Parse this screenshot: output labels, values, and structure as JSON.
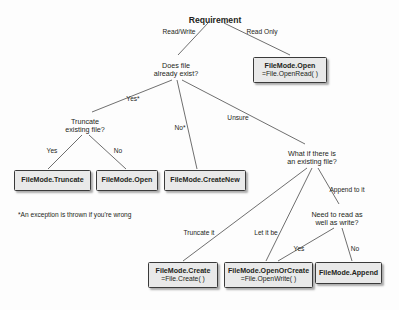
{
  "diagram": {
    "type": "decision-tree",
    "title": "Requirement",
    "background_color": "#fdfdfd",
    "text_color": "#231f20",
    "box_fill_color": "#e9e9e9",
    "box_border_color": "#3a3a3a",
    "footnote": "*An exception is thrown if you're wrong"
  },
  "nodes": {
    "root": {
      "label": "Requirement",
      "x": 215,
      "y": 16
    },
    "does_file_exist": {
      "label": "Does file\nalready exist?",
      "x": 176,
      "y": 62
    },
    "truncate_existing": {
      "label": "Truncate\nexisting file?",
      "x": 85,
      "y": 118
    },
    "what_if_existing": {
      "label": "What if there is\nan existing file?",
      "x": 312,
      "y": 150
    },
    "need_to_read": {
      "label": "Need to read as\nwell as write?",
      "x": 337,
      "y": 211
    }
  },
  "terminals": [
    {
      "id": "filemode-open-readonly",
      "title": "FileMode.Open",
      "sub": "=File.OpenRead( )",
      "x": 253,
      "y": 57,
      "w": 74,
      "h": 26
    },
    {
      "id": "filemode-truncate",
      "title": "FileMode.Truncate",
      "sub": "",
      "x": 14,
      "y": 170,
      "w": 77,
      "h": 21
    },
    {
      "id": "filemode-open",
      "title": "FileMode.Open",
      "sub": "",
      "x": 96,
      "y": 170,
      "w": 62,
      "h": 21
    },
    {
      "id": "filemode-createnew",
      "title": "FileMode.CreateNew",
      "sub": "",
      "x": 164,
      "y": 170,
      "w": 82,
      "h": 21
    },
    {
      "id": "filemode-create",
      "title": "FileMode.Create",
      "sub": "=File.Create( )",
      "x": 148,
      "y": 262,
      "w": 70,
      "h": 26
    },
    {
      "id": "filemode-openorcreate",
      "title": "FileMode.OpenOrCreate",
      "sub": "=File.OpenWrite( )",
      "x": 224,
      "y": 262,
      "w": 89,
      "h": 26
    },
    {
      "id": "filemode-append",
      "title": "FileMode.Append",
      "sub": "",
      "x": 315,
      "y": 262,
      "w": 67,
      "h": 22
    }
  ],
  "edge_labels": [
    {
      "id": "read-write",
      "text": "Read/Write",
      "x": 179,
      "y": 32
    },
    {
      "id": "read-only",
      "text": "Read Only",
      "x": 262,
      "y": 32
    },
    {
      "id": "yes-star",
      "text": "Yes*",
      "x": 133,
      "y": 99
    },
    {
      "id": "no-star",
      "text": "No*",
      "x": 180,
      "y": 128
    },
    {
      "id": "unsure",
      "text": "Unsure",
      "x": 238,
      "y": 118
    },
    {
      "id": "truncate-yes",
      "text": "Yes",
      "x": 52,
      "y": 151
    },
    {
      "id": "truncate-no",
      "text": "No",
      "x": 118,
      "y": 151
    },
    {
      "id": "append-to-it",
      "text": "Append to it",
      "x": 347,
      "y": 190
    },
    {
      "id": "truncate-it",
      "text": "Truncate it",
      "x": 199,
      "y": 233
    },
    {
      "id": "let-it-be",
      "text": "Let it be",
      "x": 266,
      "y": 233
    },
    {
      "id": "read-write-yes",
      "text": "Yes",
      "x": 299,
      "y": 249
    },
    {
      "id": "read-write-no",
      "text": "No",
      "x": 355,
      "y": 249
    }
  ],
  "edges": [
    {
      "id": "root-to-does-file-exist",
      "x1": 208,
      "y1": 23,
      "x2": 178,
      "y2": 55
    },
    {
      "id": "root-to-filemode-open",
      "x1": 224,
      "y1": 23,
      "x2": 290,
      "y2": 55
    },
    {
      "id": "does-file-exist-to-truncate",
      "x1": 172,
      "y1": 80,
      "x2": 92,
      "y2": 112
    },
    {
      "id": "does-file-exist-to-createnew",
      "x1": 177,
      "y1": 80,
      "x2": 197,
      "y2": 169
    },
    {
      "id": "does-file-exist-to-what-if",
      "x1": 182,
      "y1": 80,
      "x2": 305,
      "y2": 144
    },
    {
      "id": "truncate-to-yes-box",
      "x1": 82,
      "y1": 135,
      "x2": 48,
      "y2": 169
    },
    {
      "id": "truncate-to-no-box",
      "x1": 89,
      "y1": 135,
      "x2": 126,
      "y2": 169
    },
    {
      "id": "what-if-to-create",
      "x1": 307,
      "y1": 168,
      "x2": 183,
      "y2": 261
    },
    {
      "id": "what-if-to-openorcreate",
      "x1": 312,
      "y1": 168,
      "x2": 266,
      "y2": 261
    },
    {
      "id": "what-if-to-need-to-read",
      "x1": 318,
      "y1": 168,
      "x2": 339,
      "y2": 204
    },
    {
      "id": "need-to-read-to-openorcreate",
      "x1": 334,
      "y1": 228,
      "x2": 278,
      "y2": 261
    },
    {
      "id": "need-to-read-to-append",
      "x1": 342,
      "y1": 228,
      "x2": 352,
      "y2": 261
    }
  ]
}
